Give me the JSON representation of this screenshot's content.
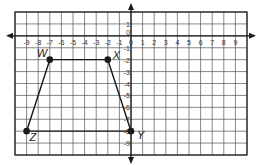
{
  "diagram": {
    "type": "coordinate-plane",
    "x_range": [
      -10,
      10
    ],
    "y_range": [
      -10,
      2
    ],
    "x_tick_labels": [
      "-9",
      "-8",
      "-7",
      "-6",
      "-5",
      "-4",
      "-3",
      "-2",
      "-1",
      "0",
      "1",
      "2",
      "3",
      "4",
      "5",
      "6",
      "7",
      "8",
      "9"
    ],
    "y_tick_labels": [
      "1",
      "0",
      "-1",
      "-2",
      "-3",
      "-4",
      "-5",
      "-6",
      "-7",
      "-8",
      "-9"
    ],
    "shape": "trapezoid",
    "points": [
      {
        "label": "W",
        "x": -7,
        "y": -2
      },
      {
        "label": "X",
        "x": -2,
        "y": -2
      },
      {
        "label": "Y",
        "x": 0,
        "y": -8
      },
      {
        "label": "Z",
        "x": -9,
        "y": -8
      }
    ],
    "colors": {
      "grid": "#555555",
      "ink": "#1a1a1a",
      "background": "#ffffff"
    }
  }
}
